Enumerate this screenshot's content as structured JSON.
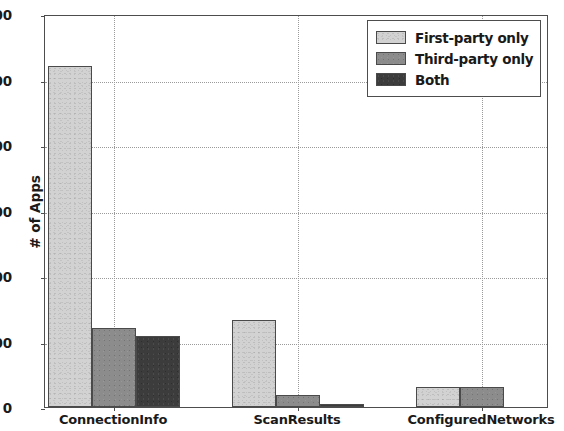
{
  "chart_data": {
    "type": "bar",
    "title": "",
    "xlabel": "",
    "ylabel": "# of Apps",
    "categories": [
      "ConnectionInfo",
      "ScanResults",
      "ConfiguredNetworks"
    ],
    "series": [
      {
        "name": "First-party only",
        "values": [
          520,
          133,
          30
        ],
        "color": "#d2d2d2"
      },
      {
        "name": "Third-party only",
        "values": [
          120,
          18,
          31
        ],
        "color": "#8c8c8c"
      },
      {
        "name": "Both",
        "values": [
          108,
          4,
          0
        ],
        "color": "#3c3c3c"
      }
    ],
    "ylim": [
      0,
      600
    ],
    "yticks": [
      0,
      100,
      200,
      300,
      400,
      500,
      600
    ],
    "ytick_labels": [
      "0",
      "100",
      "200",
      "300",
      "400",
      "500",
      "600"
    ],
    "grid": true,
    "grid_style": "dotted",
    "legend_position": "upper right"
  },
  "axes": {
    "y_title": "# of Apps"
  },
  "legend": {
    "entries": [
      {
        "label": "First-party only"
      },
      {
        "label": "Third-party only"
      },
      {
        "label": "Both"
      }
    ]
  }
}
